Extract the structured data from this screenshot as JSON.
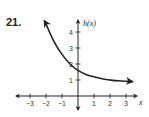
{
  "problem": {
    "number": "21."
  },
  "chart_data": {
    "type": "line",
    "title": "",
    "xlabel": "x",
    "ylabel": "h(x)",
    "xlim": [
      -3.5,
      3.5
    ],
    "ylim": [
      -1,
      5
    ],
    "xticks": [
      -3,
      -2,
      -1,
      1,
      2,
      3
    ],
    "yticks": [
      1,
      2,
      3,
      4
    ],
    "xtick_labels": [
      "−3",
      "−2",
      "−1",
      "1",
      "2",
      "3"
    ],
    "ytick_labels": [
      "1",
      "2",
      "3",
      "4"
    ],
    "grid": false,
    "legend": null,
    "series": [
      {
        "name": "h(x)",
        "description": "decreasing exponential curve with arrows at both ends, approaching horizontal asymptote near y≈0.8",
        "x": [
          -2.1,
          -2,
          -1.5,
          -1,
          -0.5,
          0,
          0.5,
          1,
          1.5,
          2,
          2.5,
          3,
          3.4
        ],
        "y": [
          4.7,
          4.5,
          3.4,
          2.6,
          2.0,
          1.6,
          1.35,
          1.2,
          1.08,
          1.0,
          0.95,
          0.92,
          0.9
        ]
      }
    ]
  }
}
